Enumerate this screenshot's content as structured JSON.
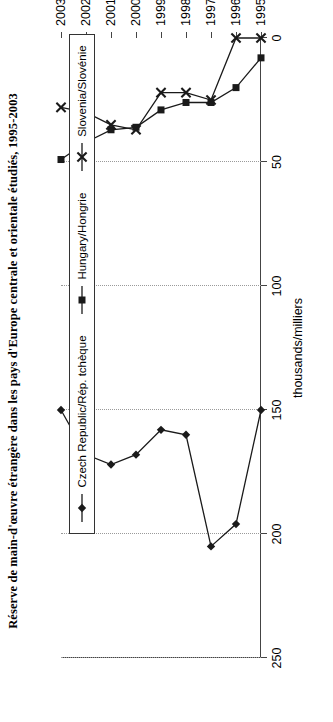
{
  "title": "Réserve de main-d'œuvre étrangère dans les pays d'Europe centrale et orientale étudiés, 1995-2003",
  "chart_data": {
    "type": "line",
    "title": "Réserve de main-d'œuvre étrangère dans les pays d'Europe centrale et orientale étudiés, 1995-2003",
    "xlabel": "",
    "ylabel": "thousands/milliers",
    "categories": [
      "1995",
      "1996",
      "1997",
      "1998",
      "1999",
      "2000",
      "2001",
      "2002",
      "2003"
    ],
    "ylim": [
      0,
      250
    ],
    "yticks": [
      0,
      50,
      100,
      150,
      200,
      250
    ],
    "grid": "vertical-dotted-on-value-axis",
    "orientation": "rotated-90-ccw",
    "legend_position": "right",
    "series": [
      {
        "name": "Czech Republic/Rép. tchèque",
        "marker": "filled-diamond",
        "color": "#1a1a1a",
        "values": [
          150,
          196,
          205,
          160,
          158,
          168,
          172,
          168,
          150
        ]
      },
      {
        "name": "Hungary/Hongrie",
        "marker": "filled-square",
        "color": "#1a1a1a",
        "values": [
          8,
          20,
          26,
          26,
          29,
          36,
          37,
          42,
          49
        ]
      },
      {
        "name": "Slovenia/Slovénie",
        "marker": "cross-star",
        "color": "#1a1a1a",
        "values": [
          0,
          0,
          25,
          22,
          22,
          37,
          35,
          30,
          28
        ]
      }
    ]
  },
  "axis": {
    "y_tick_labels": [
      "0",
      "50",
      "100",
      "150",
      "200",
      "250"
    ],
    "x_tick_labels": [
      "1995",
      "1996",
      "1997",
      "1998",
      "1999",
      "2000",
      "2001",
      "2002",
      "2003"
    ],
    "y_axis_title": "thousands/milliers"
  },
  "legend": {
    "items": [
      {
        "label": "Czech Republic/Rép. tchèque",
        "marker": "filled-diamond"
      },
      {
        "label": "Hungary/Hongrie",
        "marker": "filled-square"
      },
      {
        "label": "Slovenia/Slovénie",
        "marker": "cross-star"
      }
    ]
  }
}
